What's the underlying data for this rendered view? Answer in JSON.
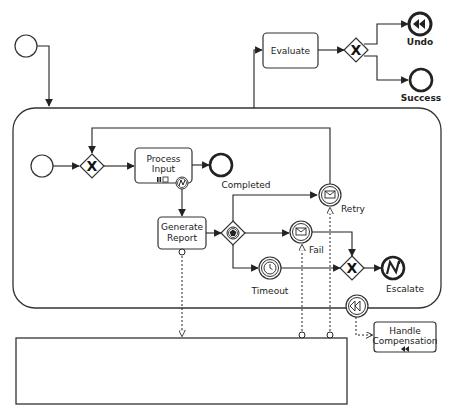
{
  "diagram": {
    "type": "BPMN process",
    "colors": {
      "stroke": "#222222",
      "fill": "#ffffff"
    },
    "tasks": {
      "evaluate": {
        "label": "Evaluate"
      },
      "process_input": {
        "label_line1": "Process",
        "label_line2": "Input"
      },
      "generate_report": {
        "label_line1": "Generate",
        "label_line2": "Report"
      },
      "handle_compensation": {
        "label_line1": "Handle",
        "label_line2": "Compensation"
      }
    },
    "events": {
      "outer_start": {
        "label": ""
      },
      "inner_start": {
        "label": ""
      },
      "undo": {
        "label": "Undo",
        "icon": "compensation-icon"
      },
      "success": {
        "label": "Success"
      },
      "completed": {
        "label": "Completed"
      },
      "retry": {
        "label": "Retry",
        "icon": "message-icon"
      },
      "fail": {
        "label": "Fail",
        "icon": "message-icon"
      },
      "timeout": {
        "label": "Timeout",
        "icon": "timer-icon"
      },
      "escalate": {
        "label": "Escalate",
        "icon": "error-icon"
      },
      "compensation_boundary": {
        "label": "",
        "icon": "compensation-icon"
      }
    },
    "gateways": {
      "outer_exclusive": {
        "type": "exclusive"
      },
      "inner_exclusive": {
        "type": "exclusive"
      },
      "event_based": {
        "type": "event-based"
      },
      "merge_exclusive": {
        "type": "exclusive"
      }
    },
    "pool": {
      "label": ""
    },
    "subprocess": {
      "label": ""
    }
  }
}
